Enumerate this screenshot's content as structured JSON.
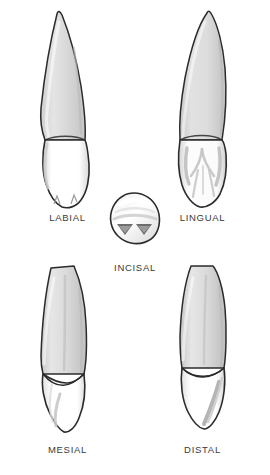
{
  "figure": {
    "background_color": "#ffffff",
    "outline_color": "#2b2b2b",
    "root_fill_color": "#d9d9d9",
    "root_shade_color": "#bdbdbd",
    "crown_fill_color": "#ffffff",
    "crown_shade_color": "#c9c9c9",
    "label_color": "#3a3a3a"
  },
  "views": {
    "labial": {
      "label": "LABIAL",
      "icon": "tooth-labial-icon"
    },
    "lingual": {
      "label": "LINGUAL",
      "icon": "tooth-lingual-icon"
    },
    "incisal": {
      "label": "INCISAL",
      "icon": "tooth-incisal-icon"
    },
    "mesial": {
      "label": "MESIAL",
      "icon": "tooth-mesial-icon"
    },
    "distal": {
      "label": "DISTAL",
      "icon": "tooth-distal-icon"
    }
  }
}
